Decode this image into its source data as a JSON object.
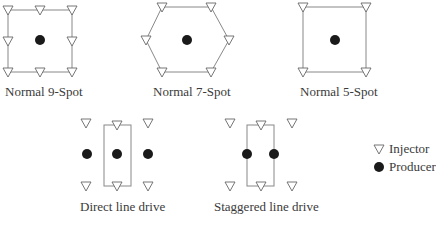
{
  "diagram": {
    "patterns": [
      {
        "name": "Normal 9-Spot",
        "injectors": 8,
        "producers": 1,
        "shape": "square"
      },
      {
        "name": "Normal 7-Spot",
        "injectors": 6,
        "producers": 1,
        "shape": "hexagon"
      },
      {
        "name": "Normal 5-Spot",
        "injectors": 4,
        "producers": 1,
        "shape": "square"
      },
      {
        "name": "Direct line drive",
        "injectors": 6,
        "producers": 3,
        "shape": "rectangle"
      },
      {
        "name": "Staggered line drive",
        "injectors": 6,
        "producers": 2,
        "shape": "rectangle"
      }
    ],
    "legend": {
      "injector": {
        "symbol": "▽",
        "label": "Injector"
      },
      "producer": {
        "symbol": "●",
        "label": "Producer"
      }
    },
    "colors": {
      "line": "#888888",
      "producer": "#1a1a1a",
      "injector_stroke": "#666666"
    }
  }
}
